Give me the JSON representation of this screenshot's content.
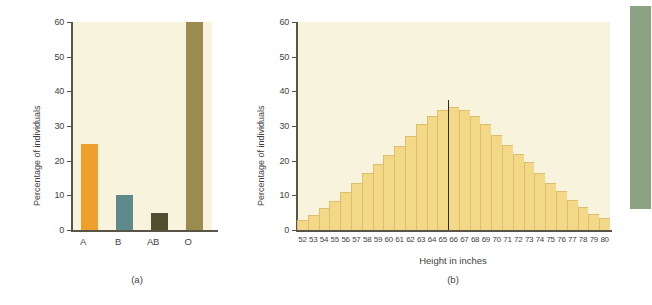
{
  "figure": {
    "panels": [
      {
        "caption": "(a)",
        "ylabel": "Percentage of individuals",
        "xlabel": ""
      },
      {
        "caption": "(b)",
        "ylabel": "Percentage of individuals",
        "xlabel": "Height in inches"
      }
    ]
  },
  "colors": {
    "plot_background": "#f8f3dc",
    "axis": "#5a5348",
    "bar_a": "#efa02c",
    "bar_b": "#5f8a8b",
    "bar_ab": "#4f4f32",
    "bar_o": "#9c8b4f",
    "histogram_fill": "#f3d888",
    "histogram_edge": "#dcbe6c",
    "mean_line": "#2b2b2b",
    "side_swatch": "#8aa383"
  },
  "chart_data": [
    {
      "type": "bar",
      "title": "",
      "xlabel": "",
      "ylabel": "Percentage of individuals",
      "categories": [
        "A",
        "B",
        "AB",
        "O"
      ],
      "values": [
        24.8,
        10.1,
        5.0,
        60.0
      ],
      "colors": [
        "#efa02c",
        "#5f8a8b",
        "#4f4f32",
        "#9c8b4f"
      ],
      "ylim": [
        0,
        60
      ],
      "yticks": [
        0,
        10,
        20,
        30,
        40,
        50,
        60
      ],
      "grid": false,
      "legend": "none",
      "caption": "(a)"
    },
    {
      "type": "bar",
      "title": "",
      "xlabel": "Height in inches",
      "ylabel": "Percentage of individuals",
      "categories": [
        "52",
        "53",
        "54",
        "55",
        "56",
        "57",
        "58",
        "59",
        "60",
        "61",
        "62",
        "63",
        "64",
        "65",
        "66",
        "67",
        "68",
        "69",
        "70",
        "71",
        "72",
        "73",
        "74",
        "75",
        "76",
        "77",
        "78",
        "79",
        "80"
      ],
      "values": [
        2.8,
        4.2,
        6.3,
        8.3,
        10.9,
        13.6,
        16.5,
        19.1,
        21.7,
        24.2,
        27.0,
        30.5,
        33.0,
        34.5,
        35.6,
        34.5,
        33.0,
        30.6,
        27.4,
        24.4,
        22.0,
        19.5,
        16.4,
        13.7,
        11.2,
        8.7,
        6.6,
        4.7,
        3.6
      ],
      "ylim": [
        0,
        60
      ],
      "yticks": [
        0,
        10,
        20,
        30,
        40,
        50,
        60
      ],
      "annotations": [
        {
          "type": "vertical-line",
          "at_category": "66",
          "label": "mean-marker",
          "value_top": 37.5
        }
      ],
      "grid": false,
      "legend": "none",
      "caption": "(b)"
    }
  ]
}
